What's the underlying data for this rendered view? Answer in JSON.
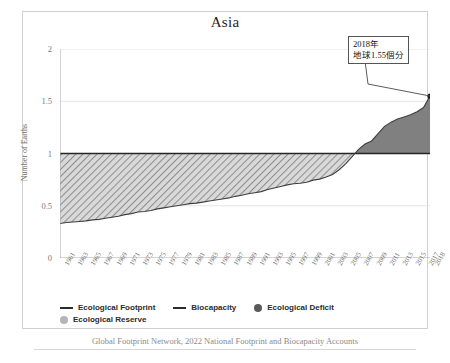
{
  "chart_data": {
    "type": "area",
    "title": "Asia",
    "xlabel": "",
    "ylabel": "Number of Earths",
    "ylim": [
      0,
      2
    ],
    "yticks": [
      "0",
      "0.5",
      "1",
      "1.5",
      "2"
    ],
    "grid": "horizontal",
    "legend_position": "bottom",
    "x_start": 1961,
    "x_end": 2018,
    "categories": [
      1961,
      1962,
      1963,
      1964,
      1965,
      1966,
      1967,
      1968,
      1969,
      1970,
      1971,
      1972,
      1973,
      1974,
      1975,
      1976,
      1977,
      1978,
      1979,
      1980,
      1981,
      1982,
      1983,
      1984,
      1985,
      1986,
      1987,
      1988,
      1989,
      1990,
      1991,
      1992,
      1993,
      1994,
      1995,
      1996,
      1997,
      1998,
      1999,
      2000,
      2001,
      2002,
      2003,
      2004,
      2005,
      2006,
      2007,
      2008,
      2009,
      2010,
      2011,
      2012,
      2013,
      2014,
      2015,
      2016,
      2017,
      2018
    ],
    "xtick_labels": [
      "1961",
      "1963",
      "1965",
      "1967",
      "1969",
      "1971",
      "1973",
      "1975",
      "1977",
      "1979",
      "1981",
      "1983",
      "1985",
      "1987",
      "1989",
      "1991",
      "1993",
      "1995",
      "1997",
      "1999",
      "2001",
      "2003",
      "2005",
      "2007",
      "2009",
      "2011",
      "2013",
      "2015",
      "2017",
      "2018"
    ],
    "series": [
      {
        "name": "Ecological Footprint",
        "color": "#3f3f3f",
        "values": [
          0.33,
          0.34,
          0.345,
          0.35,
          0.355,
          0.365,
          0.37,
          0.38,
          0.39,
          0.4,
          0.415,
          0.425,
          0.44,
          0.445,
          0.455,
          0.47,
          0.48,
          0.49,
          0.5,
          0.51,
          0.52,
          0.525,
          0.535,
          0.545,
          0.555,
          0.565,
          0.575,
          0.59,
          0.6,
          0.615,
          0.625,
          0.635,
          0.655,
          0.67,
          0.685,
          0.7,
          0.71,
          0.715,
          0.725,
          0.745,
          0.755,
          0.775,
          0.8,
          0.845,
          0.9,
          0.97,
          1.04,
          1.09,
          1.12,
          1.19,
          1.26,
          1.3,
          1.33,
          1.35,
          1.37,
          1.4,
          1.44,
          1.55
        ]
      },
      {
        "name": "Biocapacity",
        "color": "#262626",
        "values": [
          1,
          1,
          1,
          1,
          1,
          1,
          1,
          1,
          1,
          1,
          1,
          1,
          1,
          1,
          1,
          1,
          1,
          1,
          1,
          1,
          1,
          1,
          1,
          1,
          1,
          1,
          1,
          1,
          1,
          1,
          1,
          1,
          1,
          1,
          1,
          1,
          1,
          1,
          1,
          1,
          1,
          1,
          1,
          1,
          1,
          1,
          1,
          1,
          1,
          1,
          1,
          1,
          1,
          1,
          1,
          1,
          1,
          1
        ]
      }
    ],
    "areas": [
      {
        "name": "Ecological Reserve",
        "color": "#b3b3b3",
        "pattern": "diagonal-hatch"
      },
      {
        "name": "Ecological Deficit",
        "color": "#808080",
        "pattern": "solid"
      }
    ],
    "annotations": [
      {
        "name": "final-value-callout",
        "line1": "2018年",
        "line2": "地球1.55個分",
        "year": 2018,
        "value": 1.55
      }
    ],
    "source": "Global Footprint Network, 2022 National Footprint and Biocapacity Accounts"
  },
  "legend": {
    "items": [
      {
        "label": "Ecological Footprint",
        "marker": "line",
        "color": "#2b2b2b"
      },
      {
        "label": "Biocapacity",
        "marker": "line",
        "color": "#2b2b2b"
      },
      {
        "label": "Ecological Deficit",
        "marker": "dot",
        "color": "#5a5a5a"
      },
      {
        "label": "Ecological Reserve",
        "marker": "dot",
        "color": "#b5b5b5"
      }
    ]
  }
}
